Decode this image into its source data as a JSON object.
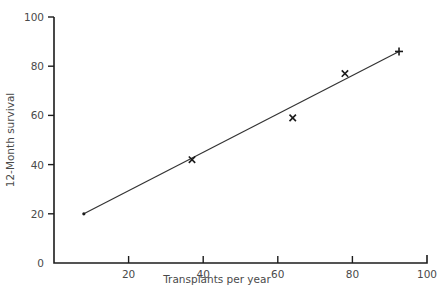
{
  "chart_data": {
    "type": "scatter",
    "title": "",
    "xlabel": "Transplants per year",
    "ylabel": "12-Month survival",
    "xlim": [
      0,
      100
    ],
    "ylim": [
      0,
      100
    ],
    "x_ticks": [
      20,
      40,
      60,
      80,
      100
    ],
    "y_ticks": [
      0,
      20,
      40,
      60,
      80,
      100
    ],
    "grid": false,
    "legend": null,
    "series": [
      {
        "name": "observed (x markers)",
        "marker": "x",
        "points": [
          {
            "x": 37,
            "y": 42
          },
          {
            "x": 64,
            "y": 59
          },
          {
            "x": 78,
            "y": 77
          }
        ]
      },
      {
        "name": "observed (+ marker)",
        "marker": "+",
        "points": [
          {
            "x": 92.5,
            "y": 86
          }
        ]
      },
      {
        "name": "fitted line",
        "type": "line",
        "points": [
          {
            "x": 8,
            "y": 20
          },
          {
            "x": 92.5,
            "y": 86
          }
        ]
      }
    ]
  },
  "labels": {
    "xlabel": "Transplants per year",
    "ylabel": "12-Month survival",
    "x_tick_labels": [
      "20",
      "40",
      "60",
      "80",
      "100"
    ],
    "y_tick_labels": [
      "0",
      "20",
      "40",
      "60",
      "80",
      "100"
    ]
  }
}
